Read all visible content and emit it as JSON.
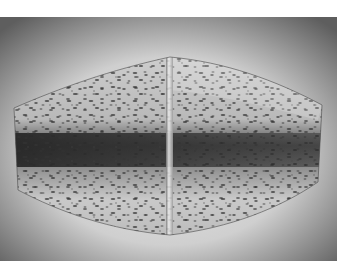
{
  "image": {
    "subject": "speckled stone artifact",
    "description": "Grayscale photograph of a faceted, speckled stone object with a central vertical ridge and a dark horizontal band, on a vignetted gray background",
    "width": 337,
    "height": 278,
    "photo_bounds": {
      "x": 0,
      "y": 17,
      "width": 337,
      "height": 244
    },
    "colors": {
      "page_background": "#ffffff",
      "backdrop_light": "#e2e2e2",
      "backdrop_dark": "#6a6a6a",
      "stone_light": "#d8d8d8",
      "stone_mid": "#a9a9a9",
      "band_dark": "#3a3a3a",
      "speckle": "#3f3f3f"
    }
  }
}
